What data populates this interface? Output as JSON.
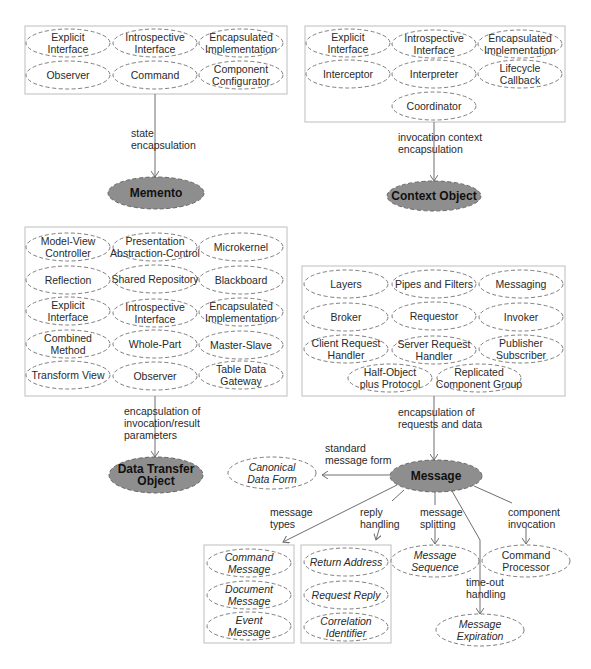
{
  "diagram": {
    "central_patterns": [
      {
        "id": "memento",
        "label": [
          "Memento"
        ],
        "cx": 156,
        "cy": 193,
        "rx": 48,
        "ry": 16
      },
      {
        "id": "context-object",
        "label": [
          "Context Object"
        ],
        "cx": 434,
        "cy": 196,
        "rx": 47,
        "ry": 15
      },
      {
        "id": "data-transfer-object",
        "label": [
          "Data Transfer",
          "Object"
        ],
        "cx": 156,
        "cy": 475,
        "rx": 47,
        "ry": 18
      },
      {
        "id": "message",
        "label": [
          "Message"
        ],
        "cx": 436,
        "cy": 476,
        "rx": 46,
        "ry": 16
      }
    ],
    "groups": [
      {
        "id": "memento-group",
        "box": {
          "x": 25,
          "y": 26,
          "w": 262,
          "h": 68
        },
        "patterns": [
          {
            "label": [
              "Explicit",
              "Interface"
            ],
            "cx": 68,
            "cy": 43
          },
          {
            "label": [
              "Introspective",
              "Interface"
            ],
            "cx": 155,
            "cy": 43
          },
          {
            "label": [
              "Encapsulated",
              "Implementation"
            ],
            "cx": 241,
            "cy": 43
          },
          {
            "label": [
              "Observer"
            ],
            "cx": 68,
            "cy": 75
          },
          {
            "label": [
              "Command"
            ],
            "cx": 155,
            "cy": 75
          },
          {
            "label": [
              "Component",
              "Configurator"
            ],
            "cx": 241,
            "cy": 75
          }
        ]
      },
      {
        "id": "context-object-group",
        "box": {
          "x": 305,
          "y": 26,
          "w": 260,
          "h": 96
        },
        "patterns": [
          {
            "label": [
              "Explicit",
              "Interface"
            ],
            "cx": 348,
            "cy": 43
          },
          {
            "label": [
              "Introspective",
              "Interface"
            ],
            "cx": 434,
            "cy": 44
          },
          {
            "label": [
              "Encapsulated",
              "Implementation"
            ],
            "cx": 520,
            "cy": 44
          },
          {
            "label": [
              "Interceptor"
            ],
            "cx": 348,
            "cy": 74
          },
          {
            "label": [
              "Interpreter"
            ],
            "cx": 434,
            "cy": 74
          },
          {
            "label": [
              "Lifecycle",
              "Callback"
            ],
            "cx": 520,
            "cy": 74
          },
          {
            "label": [
              "Coordinator"
            ],
            "cx": 434,
            "cy": 106
          }
        ]
      },
      {
        "id": "dto-group",
        "box": {
          "x": 25,
          "y": 227,
          "w": 262,
          "h": 169
        },
        "patterns": [
          {
            "label": [
              "Model-View",
              "Controller"
            ],
            "cx": 68,
            "cy": 247
          },
          {
            "label": [
              "Presentation",
              "Abstraction-Control"
            ],
            "cx": 155,
            "cy": 247
          },
          {
            "label": [
              "Microkernel"
            ],
            "cx": 241,
            "cy": 247
          },
          {
            "label": [
              "Reflection"
            ],
            "cx": 68,
            "cy": 280
          },
          {
            "label": [
              "Shared Repository"
            ],
            "cx": 155,
            "cy": 279
          },
          {
            "label": [
              "Blackboard"
            ],
            "cx": 241,
            "cy": 280
          },
          {
            "label": [
              "Explicit",
              "Interface"
            ],
            "cx": 68,
            "cy": 311
          },
          {
            "label": [
              "Introspective",
              "Interface"
            ],
            "cx": 155,
            "cy": 313
          },
          {
            "label": [
              "Encapsulated",
              "Implementation"
            ],
            "cx": 241,
            "cy": 312
          },
          {
            "label": [
              "Combined",
              "Method"
            ],
            "cx": 68,
            "cy": 344
          },
          {
            "label": [
              "Whole-Part"
            ],
            "cx": 155,
            "cy": 344
          },
          {
            "label": [
              "Master-Slave"
            ],
            "cx": 241,
            "cy": 345
          },
          {
            "label": [
              "Transform View"
            ],
            "cx": 68,
            "cy": 375
          },
          {
            "label": [
              "Observer"
            ],
            "cx": 155,
            "cy": 376
          },
          {
            "label": [
              "Table Data",
              "Gateway"
            ],
            "cx": 241,
            "cy": 375
          }
        ]
      },
      {
        "id": "message-group",
        "box": {
          "x": 302,
          "y": 266,
          "w": 263,
          "h": 130
        },
        "patterns": [
          {
            "label": [
              "Layers"
            ],
            "cx": 346,
            "cy": 284
          },
          {
            "label": [
              "Pipes and Filters"
            ],
            "cx": 434,
            "cy": 284
          },
          {
            "label": [
              "Messaging"
            ],
            "cx": 521,
            "cy": 284
          },
          {
            "label": [
              "Broker"
            ],
            "cx": 346,
            "cy": 317
          },
          {
            "label": [
              "Requestor"
            ],
            "cx": 434,
            "cy": 316
          },
          {
            "label": [
              "Invoker"
            ],
            "cx": 521,
            "cy": 317
          },
          {
            "label": [
              "Client Request",
              "Handler"
            ],
            "cx": 346,
            "cy": 349
          },
          {
            "label": [
              "Server Request",
              "Handler"
            ],
            "cx": 434,
            "cy": 350
          },
          {
            "label": [
              "Publisher",
              "Subscriber"
            ],
            "cx": 521,
            "cy": 349
          },
          {
            "label": [
              "Half-Object",
              "plus Protocol"
            ],
            "cx": 390,
            "cy": 378
          },
          {
            "label": [
              "Replicated",
              "Component Group"
            ],
            "cx": 479,
            "cy": 378
          }
        ]
      },
      {
        "id": "message-types-group",
        "box": {
          "x": 204,
          "y": 545,
          "w": 90,
          "h": 98
        },
        "patterns": [
          {
            "label": [
              "Command",
              "Message"
            ],
            "cx": 249,
            "cy": 563,
            "italic": true
          },
          {
            "label": [
              "Document",
              "Message"
            ],
            "cx": 249,
            "cy": 595,
            "italic": true
          },
          {
            "label": [
              "Event",
              "Message"
            ],
            "cx": 249,
            "cy": 626,
            "italic": true
          }
        ]
      },
      {
        "id": "reply-handling-group",
        "box": {
          "x": 301,
          "y": 545,
          "w": 90,
          "h": 98
        },
        "patterns": [
          {
            "label": [
              "Return Address"
            ],
            "cx": 346,
            "cy": 562,
            "italic": true
          },
          {
            "label": [
              "Request Reply"
            ],
            "cx": 346,
            "cy": 595,
            "italic": true
          },
          {
            "label": [
              "Correlation",
              "Identifier"
            ],
            "cx": 346,
            "cy": 627,
            "italic": true
          }
        ]
      }
    ],
    "satellites": [
      {
        "id": "canonical-data-form",
        "label": [
          "Canonical",
          "Data Form"
        ],
        "cx": 272,
        "cy": 473,
        "italic": true
      },
      {
        "id": "message-sequence",
        "label": [
          "Message",
          "Sequence"
        ],
        "cx": 435,
        "cy": 561,
        "italic": true
      },
      {
        "id": "command-processor",
        "label": [
          "Command",
          "Processor"
        ],
        "cx": 526,
        "cy": 561,
        "italic": false
      },
      {
        "id": "message-expiration",
        "label": [
          "Message",
          "Expiration"
        ],
        "cx": 480,
        "cy": 630,
        "italic": true
      }
    ],
    "edges": [
      {
        "id": "state-encapsulation",
        "points": [
          [
            155,
            94
          ],
          [
            155,
            177
          ]
        ],
        "label": [
          "state",
          "encapsulation"
        ],
        "lx": 131,
        "ly": 137
      },
      {
        "id": "invocation-context-encapsulation",
        "points": [
          [
            434,
            122
          ],
          [
            434,
            181
          ]
        ],
        "label": [
          "invocation context",
          "encapsulation"
        ],
        "lx": 398,
        "ly": 141
      },
      {
        "id": "encapsulation-of-invocation-result-parameters",
        "points": [
          [
            155,
            396
          ],
          [
            155,
            457
          ]
        ],
        "label": [
          "encapsulation of",
          "invocation/result",
          "parameters"
        ],
        "lx": 124,
        "ly": 415
      },
      {
        "id": "encapsulation-of-requests-and-data",
        "points": [
          [
            434,
            396
          ],
          [
            434,
            460
          ]
        ],
        "label": [
          "encapsulation of",
          "requests and data"
        ],
        "lx": 398,
        "ly": 416
      },
      {
        "id": "standard-message-form",
        "points": [
          [
            390,
            475
          ],
          [
            322,
            475
          ]
        ],
        "label": [
          "standard",
          "message form"
        ],
        "lx": 325,
        "ly": 452
      },
      {
        "id": "message-types",
        "points": [
          [
            397,
            485
          ],
          [
            283,
            542
          ]
        ],
        "label": [
          "message",
          "types"
        ],
        "lx": 270,
        "ly": 516
      },
      {
        "id": "reply-handling",
        "points": [
          [
            404,
            490
          ],
          [
            392,
            501
          ]
        ],
        "label": [
          "reply",
          "handling"
        ],
        "lx": 360,
        "ly": 516
      },
      {
        "id": "reply-handling-arrow",
        "points": [
          [
            380,
            526
          ],
          [
            376,
            540
          ]
        ],
        "label": [],
        "lx": 0,
        "ly": 0
      },
      {
        "id": "message-splitting",
        "points": [
          [
            435,
            492
          ],
          [
            435,
            505
          ]
        ],
        "label": [
          "message",
          "splitting"
        ],
        "lx": 420,
        "ly": 516
      },
      {
        "id": "message-splitting-arrow",
        "points": [
          [
            435,
            527
          ],
          [
            435,
            544
          ]
        ],
        "label": [],
        "lx": 0,
        "ly": 0
      },
      {
        "id": "time-out-handling",
        "points": [
          [
            452,
            491
          ],
          [
            480,
            540
          ],
          [
            480,
            596
          ]
        ],
        "label": [
          "time-out",
          "handling"
        ],
        "lx": 466,
        "ly": 586
      },
      {
        "id": "time-out-handling-arrow",
        "points": [
          [
            480,
            596
          ],
          [
            480,
            614
          ]
        ],
        "label": [],
        "lx": 0,
        "ly": 0
      },
      {
        "id": "component-invocation",
        "points": [
          [
            474,
            486
          ],
          [
            512,
            503
          ]
        ],
        "label": [
          "component",
          "invocation"
        ],
        "lx": 508,
        "ly": 516
      },
      {
        "id": "component-invocation-arrow",
        "points": [
          [
            526,
            527
          ],
          [
            526,
            544
          ]
        ],
        "label": [],
        "lx": 0,
        "ly": 0
      }
    ]
  }
}
